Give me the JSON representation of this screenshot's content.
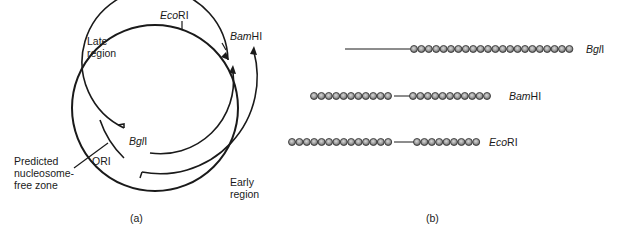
{
  "panel_a": {
    "caption": "(a)",
    "labels": {
      "late_region": [
        "Late",
        "region"
      ],
      "early_region": [
        "Early",
        "region"
      ],
      "ori": "ORI",
      "nucleosome_free": [
        "Predicted",
        "nucleosome-",
        "free zone"
      ]
    },
    "sites": [
      {
        "italic": "Eco",
        "roman": "RI"
      },
      {
        "italic": "Bam",
        "roman": "HI"
      },
      {
        "italic": "Bgl",
        "roman": "I"
      }
    ]
  },
  "panel_b": {
    "caption": "(b)",
    "rows": [
      {
        "italic": "Bgl",
        "roman": "I",
        "left_beads": 0,
        "right_beads": 22
      },
      {
        "italic": "Bam",
        "roman": "HI",
        "left_beads": 11,
        "right_beads": 11
      },
      {
        "italic": "Eco",
        "roman": "RI",
        "left_beads": 14,
        "right_beads": 9
      }
    ]
  },
  "colors": {
    "line": "#1a1a1a",
    "bead_fill": "#9a9a9a",
    "bead_stroke": "#3a3a3a"
  }
}
